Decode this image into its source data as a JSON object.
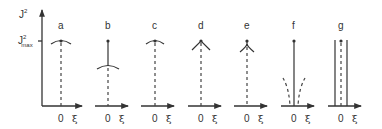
{
  "figure": {
    "y_axis_label": "J",
    "y_axis_label_sup": "2",
    "jmax_label": "J",
    "jmax_sup": "2",
    "jmax_sub": "max",
    "x_origin_label": "0",
    "x_axis_label": "ξ",
    "panels": [
      {
        "label": "a",
        "shape": "cap at Jmax, dashed line below"
      },
      {
        "label": "b",
        "shape": "dot at Jmax, solid line to lower cap, dashed below"
      },
      {
        "label": "c",
        "shape": "cap at Jmax, dashed line below"
      },
      {
        "label": "d",
        "shape": "sharp cusp (inverted V) at Jmax, dashed line below"
      },
      {
        "label": "e",
        "shape": "narrow cusp at Jmax, dashed line below"
      },
      {
        "label": "f",
        "shape": "dot at Jmax, solid line to axis, dashed diverging curves near axis"
      },
      {
        "label": "g",
        "shape": "dot at Jmax, dashed center line flanked by two solid vertical lines"
      }
    ]
  }
}
